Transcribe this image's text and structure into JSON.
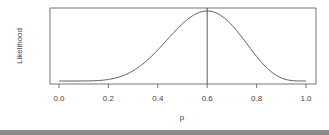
{
  "chart_data": {
    "type": "line",
    "title": "",
    "xlabel": "p",
    "ylabel": "Likelihood",
    "xlim": [
      0.0,
      1.0
    ],
    "x_ticks": [
      "0.0",
      "0.2",
      "0.4",
      "0.6",
      "0.8",
      "1.0"
    ],
    "y_ticks": [],
    "grid": false,
    "legend": null,
    "series": [
      {
        "name": "Likelihood",
        "x": [
          0.0,
          0.1,
          0.2,
          0.3,
          0.4,
          0.5,
          0.6,
          0.7,
          0.8,
          0.9,
          1.0
        ],
        "values": [
          0.0,
          0.0001,
          0.0044,
          0.0286,
          0.0895,
          0.1667,
          0.1991,
          0.1482,
          0.0671,
          0.0087,
          0.0
        ],
        "color": "#333333"
      }
    ],
    "annotations": [
      {
        "type": "vertical-line",
        "x": 0.6,
        "label": "maximum likelihood estimate"
      }
    ]
  },
  "axes": {
    "xlabel": "p",
    "ylabel": "Likelihood",
    "x_ticks": [
      "0.0",
      "0.2",
      "0.4",
      "0.6",
      "0.8",
      "1.0"
    ]
  }
}
